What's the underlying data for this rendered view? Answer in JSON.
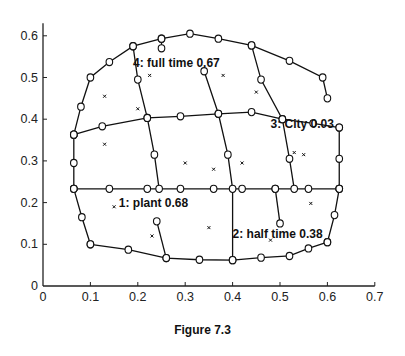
{
  "caption": "Figure 7.3",
  "chart_data": {
    "type": "scatter",
    "title": "",
    "caption": "Figure 7.3",
    "xlabel": "",
    "ylabel": "",
    "xlim": [
      0,
      0.7
    ],
    "ylim": [
      0,
      0.63
    ],
    "xticks": [
      "0",
      "0.1",
      "0.2",
      "0.3",
      "0.4",
      "0.5",
      "0.6",
      "0.7"
    ],
    "yticks": [
      "0",
      "0.1",
      "0.2",
      "0.3",
      "0.4",
      "0.5",
      "0.6"
    ],
    "grid": false,
    "legend": null,
    "grid_lines": [
      {
        "name": "bottom-boundary",
        "points": [
          [
            0.1,
            0.1
          ],
          [
            0.18,
            0.087
          ],
          [
            0.26,
            0.067
          ],
          [
            0.33,
            0.063
          ],
          [
            0.4,
            0.062
          ],
          [
            0.46,
            0.068
          ],
          [
            0.52,
            0.072
          ],
          [
            0.56,
            0.09
          ],
          [
            0.6,
            0.105
          ]
        ]
      },
      {
        "name": "left-lower",
        "points": [
          [
            0.065,
            0.233
          ],
          [
            0.082,
            0.165
          ],
          [
            0.1,
            0.1
          ]
        ]
      },
      {
        "name": "row-0.23",
        "points": [
          [
            0.065,
            0.233
          ],
          [
            0.14,
            0.233
          ],
          [
            0.22,
            0.233
          ],
          [
            0.29,
            0.233
          ],
          [
            0.36,
            0.233
          ],
          [
            0.42,
            0.233
          ],
          [
            0.49,
            0.233
          ],
          [
            0.56,
            0.233
          ],
          [
            0.625,
            0.233
          ]
        ]
      },
      {
        "name": "right-lower",
        "points": [
          [
            0.625,
            0.233
          ],
          [
            0.615,
            0.17
          ],
          [
            0.6,
            0.105
          ]
        ]
      },
      {
        "name": "row-0.37",
        "points": [
          [
            0.065,
            0.363
          ],
          [
            0.125,
            0.383
          ],
          [
            0.22,
            0.403
          ],
          [
            0.29,
            0.407
          ],
          [
            0.37,
            0.413
          ],
          [
            0.44,
            0.417
          ],
          [
            0.505,
            0.4
          ],
          [
            0.57,
            0.39
          ],
          [
            0.625,
            0.38
          ]
        ]
      },
      {
        "name": "left-mid",
        "points": [
          [
            0.065,
            0.233
          ],
          [
            0.065,
            0.295
          ],
          [
            0.065,
            0.363
          ]
        ]
      },
      {
        "name": "right-mid",
        "points": [
          [
            0.625,
            0.233
          ],
          [
            0.625,
            0.305
          ],
          [
            0.625,
            0.38
          ]
        ]
      },
      {
        "name": "top-boundary",
        "points": [
          [
            0.065,
            0.363
          ],
          [
            0.08,
            0.43
          ],
          [
            0.1,
            0.5
          ],
          [
            0.14,
            0.537
          ],
          [
            0.19,
            0.575
          ],
          [
            0.25,
            0.593
          ],
          [
            0.31,
            0.605
          ],
          [
            0.37,
            0.593
          ],
          [
            0.44,
            0.577
          ],
          [
            0.52,
            0.54
          ],
          [
            0.59,
            0.5
          ],
          [
            0.6,
            0.45
          ]
        ]
      },
      {
        "name": "col-a",
        "points": [
          [
            0.19,
            0.575
          ],
          [
            0.2,
            0.495
          ],
          [
            0.22,
            0.403
          ],
          [
            0.235,
            0.315
          ],
          [
            0.245,
            0.233
          ]
        ]
      },
      {
        "name": "col-b",
        "points": [
          [
            0.34,
            0.515
          ],
          [
            0.37,
            0.413
          ],
          [
            0.39,
            0.315
          ],
          [
            0.4,
            0.233
          ],
          [
            0.4,
            0.062
          ]
        ]
      },
      {
        "name": "col-c",
        "points": [
          [
            0.44,
            0.577
          ],
          [
            0.46,
            0.495
          ],
          [
            0.505,
            0.4
          ],
          [
            0.52,
            0.305
          ],
          [
            0.53,
            0.233
          ]
        ]
      },
      {
        "name": "col-d",
        "points": [
          [
            0.25,
            0.593
          ],
          [
            0.25,
            0.57
          ]
        ]
      },
      {
        "name": "plant-stub",
        "points": [
          [
            0.24,
            0.155
          ],
          [
            0.26,
            0.067
          ]
        ]
      },
      {
        "name": "half-stub",
        "points": [
          [
            0.49,
            0.233
          ],
          [
            0.5,
            0.15
          ]
        ]
      }
    ],
    "data_points": [
      [
        0.13,
        0.455
      ],
      [
        0.13,
        0.34
      ],
      [
        0.225,
        0.505
      ],
      [
        0.38,
        0.505
      ],
      [
        0.45,
        0.465
      ],
      [
        0.53,
        0.32
      ],
      [
        0.2,
        0.425
      ],
      [
        0.3,
        0.295
      ],
      [
        0.55,
        0.315
      ],
      [
        0.36,
        0.28
      ],
      [
        0.42,
        0.295
      ],
      [
        0.15,
        0.19
      ],
      [
        0.23,
        0.12
      ],
      [
        0.35,
        0.14
      ],
      [
        0.48,
        0.11
      ],
      [
        0.565,
        0.198
      ]
    ],
    "annotations": [
      {
        "text": "1:  plant 0.68",
        "x": 0.16,
        "y": 0.19
      },
      {
        "text": "2:  half time 0.38",
        "x": 0.4,
        "y": 0.115
      },
      {
        "text": "3: City 0.03",
        "x": 0.48,
        "y": 0.38
      },
      {
        "text": "4: full time 0.67",
        "x": 0.19,
        "y": 0.525
      }
    ]
  }
}
